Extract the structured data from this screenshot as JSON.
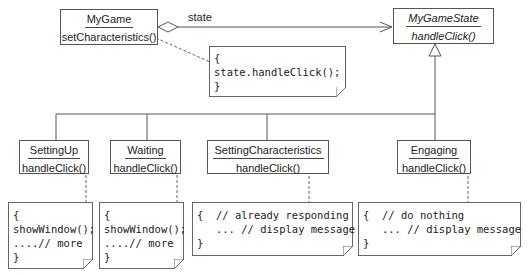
{
  "diagram": {
    "type": "UML class diagram (State pattern)",
    "context_class": {
      "name": "MyGame",
      "operation": "setCharacteristics()"
    },
    "abstract_state": {
      "name": "MyGameState",
      "operation": "handleClick()"
    },
    "association": {
      "label": "state",
      "kind": "aggregation"
    },
    "context_note": {
      "lines": [
        "{",
        "state.handleClick();",
        "}"
      ]
    },
    "states": [
      {
        "name": "SettingUp",
        "operation": "handleClick()",
        "note": [
          "{",
          "showWindow();",
          "....// more",
          "}"
        ]
      },
      {
        "name": "Waiting",
        "operation": "handleClick()",
        "note": [
          "{",
          "showWindow();",
          "....// more",
          "}"
        ]
      },
      {
        "name": "SettingCharacteristics",
        "operation": "handleClick()",
        "note": [
          "{  // already responding",
          "   ... // display message",
          "}"
        ]
      },
      {
        "name": "Engaging",
        "operation": "handleClick()",
        "note": [
          "{  // do nothing",
          "   ... // display message",
          "}"
        ]
      }
    ],
    "colors": {
      "line": "#555555",
      "text": "#222222",
      "background": "#ffffff"
    }
  }
}
